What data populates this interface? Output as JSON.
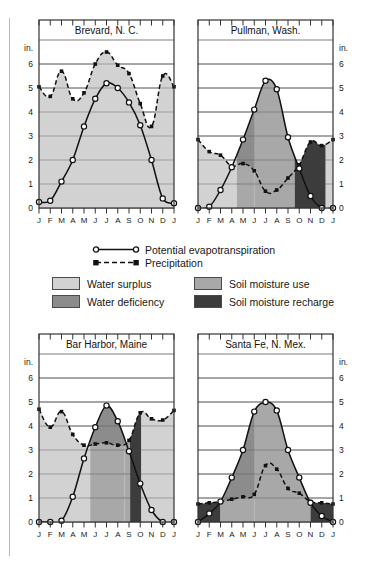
{
  "page": {
    "page_number": "",
    "unit_label": "in.",
    "y_ticks": [
      "6",
      "5",
      "4",
      "3",
      "2",
      "1",
      "0"
    ],
    "months": [
      "J",
      "F",
      "M",
      "A",
      "M",
      "J",
      "J",
      "A",
      "S",
      "O",
      "N",
      "D",
      "J"
    ]
  },
  "legend": {
    "series": [
      {
        "key": "pe",
        "label": "Potential evapotranspiration",
        "style": "solid-open-circle"
      },
      {
        "key": "precip",
        "label": "Precipitation",
        "style": "dashed-filled-square"
      }
    ],
    "areas": [
      {
        "key": "surplus",
        "label": "Water surplus",
        "color": "#d2d2d2"
      },
      {
        "key": "deficiency",
        "label": "Water deficiency",
        "color": "#8c8c8c"
      },
      {
        "key": "use",
        "label": "Soil moisture use",
        "color": "#a8a8a8"
      },
      {
        "key": "recharge",
        "label": "Soil moisture recharge",
        "color": "#3c3c3c"
      }
    ]
  },
  "colors": {
    "surplus": "#d2d2d2",
    "deficiency": "#8c8c8c",
    "use": "#a8a8a8",
    "recharge": "#3c3c3c",
    "grid": "#6e6e6e",
    "frame": "#333333",
    "line": "#111111"
  },
  "chart_data": [
    {
      "id": "brevard",
      "type": "area",
      "title": "Brevard, N. C.",
      "position": "top-left",
      "xlabel": "",
      "ylabel": "in.",
      "ylim": [
        0,
        7
      ],
      "grid": true,
      "categories": [
        "J",
        "F",
        "M",
        "A",
        "M",
        "J",
        "J",
        "A",
        "S",
        "O",
        "N",
        "D",
        "J"
      ],
      "series": [
        {
          "name": "Potential evapotranspiration",
          "key": "pe",
          "values": [
            0.25,
            0.3,
            1.1,
            2.0,
            3.4,
            4.55,
            5.2,
            5.0,
            4.4,
            3.45,
            2.0,
            0.4,
            0.2
          ]
        },
        {
          "name": "Precipitation",
          "key": "precip",
          "values": [
            5.05,
            4.65,
            5.7,
            4.55,
            4.8,
            6.0,
            6.5,
            5.95,
            5.6,
            4.35,
            3.4,
            5.5,
            5.05
          ]
        }
      ],
      "regions": [
        {
          "type": "surplus",
          "months": "J-D",
          "note": "precipitation exceeds PE all year"
        }
      ]
    },
    {
      "id": "pullman",
      "type": "area",
      "title": "Pullman, Wash.",
      "position": "top-right",
      "xlabel": "",
      "ylabel": "in.",
      "ylim": [
        0,
        7
      ],
      "grid": true,
      "categories": [
        "J",
        "F",
        "M",
        "A",
        "M",
        "J",
        "J",
        "A",
        "S",
        "O",
        "N",
        "D",
        "J"
      ],
      "series": [
        {
          "name": "Potential evapotranspiration",
          "key": "pe",
          "values": [
            0.0,
            0.05,
            0.75,
            1.7,
            2.85,
            4.1,
            5.3,
            4.95,
            2.95,
            1.65,
            0.5,
            0.0,
            0.0
          ]
        },
        {
          "name": "Precipitation",
          "key": "precip",
          "values": [
            2.85,
            2.35,
            2.2,
            1.75,
            1.85,
            1.55,
            0.7,
            0.75,
            1.25,
            1.8,
            2.75,
            2.6,
            2.85
          ]
        }
      ],
      "regions": [
        {
          "type": "use",
          "months": "May-Jul"
        },
        {
          "type": "deficiency",
          "months": "Jun-Sep"
        },
        {
          "type": "recharge",
          "months": "Oct-Dec"
        },
        {
          "type": "surplus",
          "months": "Dec-J"
        }
      ]
    },
    {
      "id": "bar-harbor",
      "type": "area",
      "title": "Bar Harbor, Maine",
      "position": "bottom-left",
      "xlabel": "",
      "ylabel": "in.",
      "ylim": [
        0,
        7
      ],
      "grid": true,
      "categories": [
        "J",
        "F",
        "M",
        "A",
        "M",
        "J",
        "J",
        "A",
        "S",
        "O",
        "N",
        "D",
        "J"
      ],
      "series": [
        {
          "name": "Potential evapotranspiration",
          "key": "pe",
          "values": [
            0.0,
            0.0,
            0.05,
            1.05,
            2.65,
            3.95,
            4.85,
            4.2,
            2.95,
            1.6,
            0.5,
            0.0,
            0.0
          ]
        },
        {
          "name": "Precipitation",
          "key": "precip",
          "values": [
            4.7,
            3.95,
            4.6,
            3.65,
            3.2,
            3.25,
            3.3,
            3.2,
            3.4,
            4.55,
            4.3,
            4.25,
            4.65
          ]
        }
      ],
      "regions": [
        {
          "type": "surplus",
          "months": "J-May"
        },
        {
          "type": "use",
          "months": "May-Aug"
        },
        {
          "type": "deficiency",
          "months": "Jun-Aug"
        },
        {
          "type": "recharge",
          "months": "Sep-Oct"
        },
        {
          "type": "surplus",
          "months": "Oct-J"
        }
      ]
    },
    {
      "id": "santa-fe",
      "type": "area",
      "title": "Santa Fe, N. Mex.",
      "position": "bottom-right",
      "xlabel": "",
      "ylabel": "in.",
      "ylim": [
        0,
        7
      ],
      "grid": true,
      "categories": [
        "J",
        "F",
        "M",
        "A",
        "M",
        "J",
        "J",
        "A",
        "S",
        "O",
        "N",
        "D",
        "J"
      ],
      "series": [
        {
          "name": "Potential evapotranspiration",
          "key": "pe",
          "values": [
            0.0,
            0.35,
            0.85,
            1.85,
            3.0,
            4.6,
            5.0,
            4.65,
            3.0,
            1.85,
            0.8,
            0.25,
            0.0
          ]
        },
        {
          "name": "Precipitation",
          "key": "precip",
          "values": [
            0.75,
            0.8,
            0.85,
            0.95,
            1.05,
            1.15,
            2.35,
            2.2,
            1.4,
            1.2,
            0.85,
            0.8,
            0.75
          ]
        }
      ],
      "regions": [
        {
          "type": "recharge",
          "months": "J-Mar"
        },
        {
          "type": "use",
          "months": "Mar-Jun"
        },
        {
          "type": "deficiency",
          "months": "May-Sep"
        },
        {
          "type": "use",
          "months": "Sep-Nov"
        },
        {
          "type": "recharge",
          "months": "Nov-J"
        }
      ]
    }
  ]
}
